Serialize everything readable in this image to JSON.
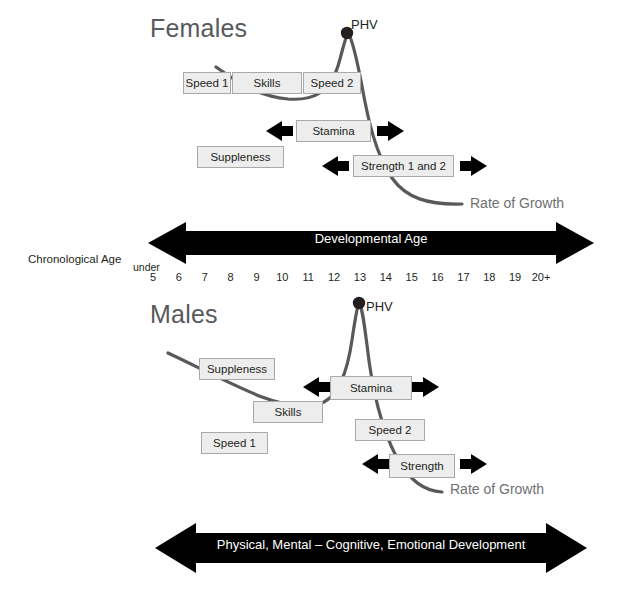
{
  "figure": {
    "sections": [
      {
        "id": "females",
        "title": "Females",
        "phv_label": "PHV",
        "rate_of_growth_label": "Rate of Growth",
        "boxes": [
          {
            "name": "speed-1",
            "label": "Speed 1"
          },
          {
            "name": "skills",
            "label": "Skills"
          },
          {
            "name": "speed-2",
            "label": "Speed 2"
          },
          {
            "name": "stamina",
            "label": "Stamina"
          },
          {
            "name": "suppleness",
            "label": "Suppleness"
          },
          {
            "name": "strength-1-and-2",
            "label": "Strength 1 and 2"
          }
        ]
      },
      {
        "id": "males",
        "title": "Males",
        "phv_label": "PHV",
        "rate_of_growth_label": "Rate of Growth",
        "boxes": [
          {
            "name": "suppleness",
            "label": "Suppleness"
          },
          {
            "name": "stamina",
            "label": "Stamina"
          },
          {
            "name": "skills",
            "label": "Skills"
          },
          {
            "name": "speed-2",
            "label": "Speed 2"
          },
          {
            "name": "speed-1",
            "label": "Speed 1"
          },
          {
            "name": "strength",
            "label": "Strength"
          }
        ]
      }
    ],
    "axis": {
      "chronological_age_label": "Chronological Age",
      "under_label": "under",
      "developmental_age_banner": "Developmental Age",
      "ticks": [
        "5",
        "6",
        "7",
        "8",
        "9",
        "10",
        "11",
        "12",
        "13",
        "14",
        "15",
        "16",
        "17",
        "18",
        "19",
        "20+"
      ]
    },
    "bottom_banner": {
      "text": "Physical, Mental – Cognitive, Emotional Development"
    },
    "colors": {
      "banner_fill": "#000000",
      "banner_text": "#ffffff",
      "box_fill": "#ededed",
      "box_border": "#a7a9ac",
      "curve": "#58595b",
      "curve_dark": "#414042",
      "title_text": "#58595b",
      "body_text": "#231f20"
    }
  }
}
